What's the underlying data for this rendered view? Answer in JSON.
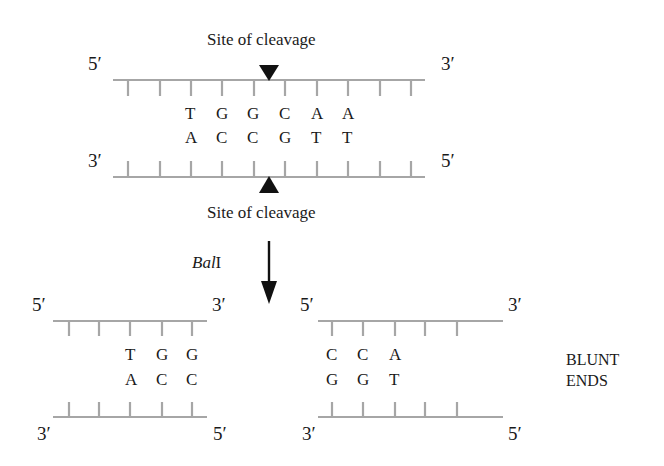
{
  "colors": {
    "strand": "#a6a6a6",
    "arrow": "#111111",
    "text": "#1a1a1a",
    "background": "#ffffff"
  },
  "top_duplex": {
    "cleavage_label_top": "Site of cleavage",
    "cleavage_label_bottom": "Site of cleavage",
    "top_strand": {
      "left_end": "5′",
      "right_end": "3′"
    },
    "bottom_strand": {
      "left_end": "3′",
      "right_end": "5′"
    },
    "top_sequence": [
      "T",
      "G",
      "G",
      "C",
      "A",
      "A"
    ],
    "bottom_sequence": [
      "A",
      "C",
      "C",
      "G",
      "T",
      "T"
    ],
    "tick_count": 10
  },
  "reaction": {
    "enzyme_italic": "Bal",
    "enzyme_suffix": "I",
    "arrow": "down-arrow"
  },
  "left_fragment": {
    "top_strand": {
      "left_end": "5′",
      "right_end": "3′"
    },
    "bottom_strand": {
      "left_end": "3′",
      "right_end": "5′"
    },
    "top_sequence": [
      "T",
      "G",
      "G"
    ],
    "bottom_sequence": [
      "A",
      "C",
      "C"
    ],
    "tick_count": 5
  },
  "right_fragment": {
    "top_strand": {
      "left_end": "5′",
      "right_end": "3′"
    },
    "bottom_strand": {
      "left_end": "3′",
      "right_end": "5′"
    },
    "top_sequence": [
      "C",
      "C",
      "A"
    ],
    "bottom_sequence": [
      "G",
      "G",
      "T"
    ],
    "tick_count": 5
  },
  "annotation": {
    "line1": "BLUNT",
    "line2": "ENDS"
  }
}
